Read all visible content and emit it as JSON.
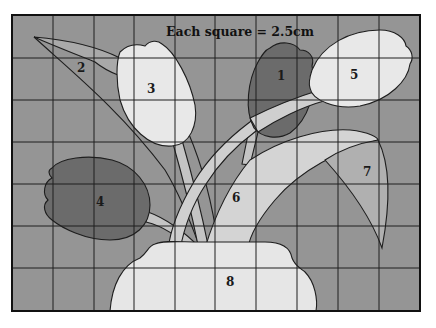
{
  "figure": {
    "title": "Each square = 2.5cm",
    "grid": {
      "columns": 10,
      "rows": 7,
      "square_size": "2.5cm"
    },
    "colors": {
      "background": "#959595",
      "light_fill": "#e6e6e6",
      "mid_light_fill": "#c9c9c9",
      "mid_fill": "#b2b2b2",
      "dark_fill": "#6b6b6b",
      "line": "#1e1e1e"
    },
    "regions": [
      {
        "id": "1",
        "label": "1",
        "description": "dark tulip head (upper middle-right)"
      },
      {
        "id": "2",
        "label": "2",
        "description": "long thin leaf (upper left)"
      },
      {
        "id": "3",
        "label": "3",
        "description": "white tulip head (upper left-center)"
      },
      {
        "id": "4",
        "label": "4",
        "description": "dark tulip head (left)"
      },
      {
        "id": "5",
        "label": "5",
        "description": "white tulip head (upper right)"
      },
      {
        "id": "6",
        "label": "6",
        "description": "large curved leaf (center)"
      },
      {
        "id": "7",
        "label": "7",
        "description": "curved leaf tip (right)"
      },
      {
        "id": "8",
        "label": "8",
        "description": "vase (bottom center)"
      }
    ]
  }
}
